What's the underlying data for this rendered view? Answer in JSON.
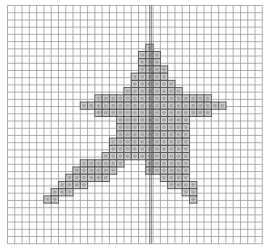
{
  "pattern": {
    "grid": {
      "origin_x": 7.5,
      "origin_y": 5.5,
      "cell_w": 7.28,
      "cell_h": 7.22,
      "cols": 35,
      "rows": 33,
      "line_color": "#9a9a9a",
      "bg_color": "#ffffff"
    },
    "tip_row": 5.37,
    "center_line": {
      "x": 150.5,
      "gap": 1.6,
      "color": "#4a4a4a"
    },
    "cell_style": {
      "fill": "#d2d2d2",
      "border": "#5a5a5a",
      "dot": "#a8a8a8"
    },
    "filled_rows": [
      {
        "row": 0,
        "spans": [
          [
            19,
            19
          ]
        ]
      },
      {
        "row": 1,
        "spans": [
          [
            18,
            20
          ]
        ]
      },
      {
        "row": 2,
        "spans": [
          [
            18,
            20
          ]
        ]
      },
      {
        "row": 3,
        "spans": [
          [
            18,
            21
          ]
        ]
      },
      {
        "row": 4,
        "spans": [
          [
            17,
            21
          ]
        ]
      },
      {
        "row": 5,
        "spans": [
          [
            17,
            22
          ]
        ]
      },
      {
        "row": 6,
        "spans": [
          [
            16,
            23
          ]
        ]
      },
      {
        "row": 7,
        "spans": [
          [
            12,
            27
          ]
        ]
      },
      {
        "row": 8,
        "spans": [
          [
            10,
            29
          ]
        ]
      },
      {
        "row": 9,
        "spans": [
          [
            12,
            27
          ]
        ]
      },
      {
        "row": 10,
        "spans": [
          [
            15,
            24
          ]
        ]
      },
      {
        "row": 11,
        "spans": [
          [
            15,
            24
          ]
        ]
      },
      {
        "row": 12,
        "spans": [
          [
            15,
            24
          ]
        ]
      },
      {
        "row": 13,
        "spans": [
          [
            14,
            24
          ]
        ]
      },
      {
        "row": 14,
        "spans": [
          [
            14,
            24
          ]
        ]
      },
      {
        "row": 15,
        "spans": [
          [
            13,
            24
          ]
        ]
      },
      {
        "row": 16,
        "spans": [
          [
            10,
            15
          ],
          [
            19,
            24
          ]
        ]
      },
      {
        "row": 17,
        "spans": [
          [
            9,
            14
          ],
          [
            19,
            24
          ]
        ]
      },
      {
        "row": 18,
        "spans": [
          [
            8,
            13
          ],
          [
            21,
            24
          ]
        ]
      },
      {
        "row": 19,
        "spans": [
          [
            7,
            10
          ],
          [
            22,
            25
          ]
        ]
      },
      {
        "row": 20,
        "spans": [
          [
            6,
            8
          ],
          [
            24,
            25
          ]
        ]
      },
      {
        "row": 21,
        "spans": [
          [
            5,
            6
          ],
          [
            25,
            25
          ]
        ]
      }
    ]
  }
}
